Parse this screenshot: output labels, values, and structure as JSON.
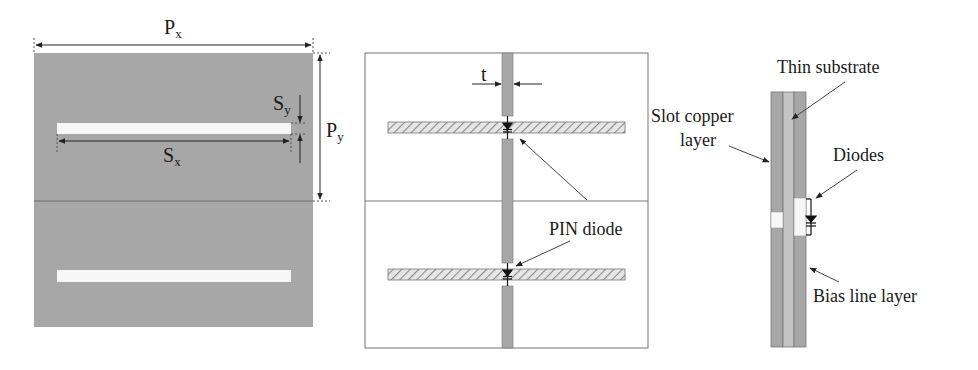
{
  "figure": {
    "panels": [
      {
        "id": "unit-cell-top-view",
        "labels": {
          "px": {
            "base": "P",
            "sub": "x"
          },
          "py": {
            "base": "P",
            "sub": "y"
          },
          "sx": {
            "base": "S",
            "sub": "x"
          },
          "sy": {
            "base": "S",
            "sub": "y"
          }
        }
      },
      {
        "id": "bias-layer-view",
        "labels": {
          "t": "t",
          "pin_diode": "PIN diode"
        }
      },
      {
        "id": "cross-section-view",
        "labels": {
          "thin_substrate": "Thin substrate",
          "slot_copper_line1": "Slot copper",
          "slot_copper_line2": "layer",
          "diodes": "Diodes",
          "bias_line_layer": "Bias line layer"
        }
      }
    ],
    "colors": {
      "copper_gray": "#a7a7a7",
      "substrate_gray": "#c4c4c4",
      "slot_white": "#f7f7f7",
      "line": "#333333",
      "hatch": "#8a8a8a"
    }
  }
}
